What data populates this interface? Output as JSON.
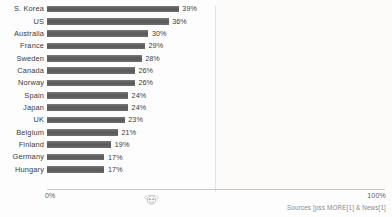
{
  "chart_data": {
    "type": "bar",
    "orientation": "horizontal",
    "title": "",
    "subtitle": "",
    "xlabel": "",
    "ylabel": "",
    "xlim": [
      0,
      100
    ],
    "grid": true,
    "legend": null,
    "value_suffix": "%",
    "categories": [
      "S. Korea",
      "US",
      "Australia",
      "France",
      "Sweden",
      "Canada",
      "Norway",
      "Spain",
      "Japan",
      "UK",
      "Belgium",
      "Finland",
      "Germany",
      "Hungary"
    ],
    "values": [
      39,
      36,
      30,
      29,
      28,
      26,
      26,
      24,
      24,
      23,
      21,
      19,
      17,
      17
    ],
    "value_labels": [
      "39%",
      "36%",
      "30%",
      "29%",
      "28%",
      "26%",
      "26%",
      "24%",
      "24%",
      "23%",
      "21%",
      "19%",
      "17%",
      "17%"
    ],
    "bar_color": "#5f5f5f",
    "axis_ticks": [
      "0%",
      "100%"
    ]
  },
  "axis": {
    "left_tick": "0%",
    "right_tick": "100%"
  },
  "footer": {
    "source": "Sources [pss MORE[1] & News[1]"
  },
  "watermark": {
    "name": "circular-logo-watermark"
  }
}
